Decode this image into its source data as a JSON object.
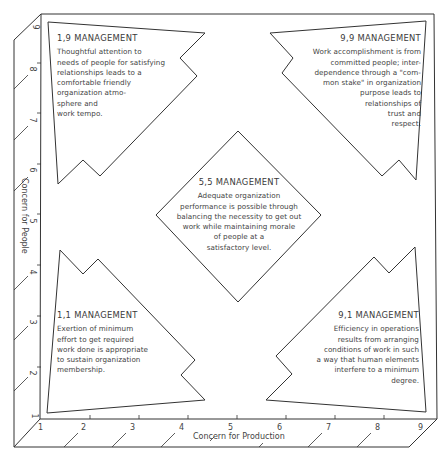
{
  "grid": {
    "x_axis_label": "Concern for Production",
    "y_axis_label": "Concern for People",
    "x_ticks": [
      "1",
      "2",
      "3",
      "4",
      "5",
      "6",
      "7",
      "8",
      "9"
    ],
    "y_ticks": [
      "1",
      "2",
      "3",
      "4",
      "5",
      "6",
      "7",
      "8",
      "9"
    ],
    "line_color": "#333333"
  },
  "styles": {
    "s19": {
      "title": "1,9 MANAGEMENT",
      "lines": [
        "Thoughtful attention to",
        "needs of people for satisfying",
        "relationships leads to a",
        "comfortable friendly",
        "organization atmo-",
        "sphere and",
        "work tempo."
      ]
    },
    "s99": {
      "title": "9,9 MANAGEMENT",
      "lines": [
        "Work accomplishment is from",
        "committed people; inter-",
        "dependence through a \"com-",
        "mon stake\" in organization",
        "purpose leads to",
        "relationships of",
        "trust and",
        "respect."
      ]
    },
    "s55": {
      "title": "5,5 MANAGEMENT",
      "lines": [
        "Adequate organization",
        "performance is possible through",
        "balancing the necessity to get out",
        "work while maintaining morale",
        "of people at a",
        "satisfactory level."
      ]
    },
    "s11": {
      "title": "1,1 MANAGEMENT",
      "lines": [
        "Exertion of minimum",
        "effort to get required",
        "work done is appropriate",
        "to sustain organization",
        "membership."
      ]
    },
    "s91": {
      "title": "9,1 MANAGEMENT",
      "lines": [
        "Efficiency in operations",
        "results from arranging",
        "conditions of work in such",
        "a way that human elements",
        "interfere to a minimum",
        "degree."
      ]
    }
  }
}
